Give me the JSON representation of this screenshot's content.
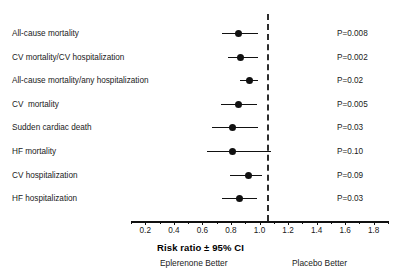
{
  "chart_data": {
    "type": "forest",
    "title": "",
    "xlabel": "Risk ratio ± 95% CI",
    "ylabel": "",
    "xlim": [
      0.1,
      1.9
    ],
    "grid": false,
    "null_value": 1.0,
    "tick_labels": [
      "0.2",
      "0.4",
      "0.6",
      "0.8",
      "1.0",
      "1.2",
      "1.4",
      "1.6",
      "1.8"
    ],
    "tick_values": [
      0.2,
      0.4,
      0.6,
      0.8,
      1.0,
      1.2,
      1.4,
      1.6,
      1.8
    ],
    "minor_tick_values": [
      0.1,
      0.3,
      0.5,
      0.7,
      0.9,
      1.1,
      1.3,
      1.5,
      1.7,
      1.9
    ],
    "left_caption": "Eplerenone Better",
    "right_caption": "Placebo Better",
    "categories": [
      "All-cause mortality",
      "CV mortality/CV hospitalization",
      "All-cause mortality/any hospitalization",
      "CV  mortality",
      "Sudden cardiac death",
      "HF mortality",
      "CV hospitalization",
      "HF hospitalization"
    ],
    "rows": [
      {
        "label": "All-cause mortality",
        "estimate": 0.85,
        "ci_low": 0.74,
        "ci_high": 0.99,
        "pvalue": "P=0.008"
      },
      {
        "label": "CV mortality/CV hospitalization",
        "estimate": 0.87,
        "ci_low": 0.78,
        "ci_high": 0.99,
        "pvalue": "P=0.002"
      },
      {
        "label": "All-cause mortality/any hospitalization",
        "estimate": 0.93,
        "ci_low": 0.86,
        "ci_high": 0.99,
        "pvalue": "P=0.02"
      },
      {
        "label": "CV  mortality",
        "estimate": 0.85,
        "ci_low": 0.73,
        "ci_high": 0.98,
        "pvalue": "P=0.005"
      },
      {
        "label": "Sudden cardiac death",
        "estimate": 0.81,
        "ci_low": 0.67,
        "ci_high": 0.99,
        "pvalue": "P=0.03"
      },
      {
        "label": "HF mortality",
        "estimate": 0.81,
        "ci_low": 0.63,
        "ci_high": 1.08,
        "pvalue": "P=0.10"
      },
      {
        "label": "CV hospitalization",
        "estimate": 0.92,
        "ci_low": 0.79,
        "ci_high": 1.02,
        "pvalue": "P=0.09"
      },
      {
        "label": "HF hospitalization",
        "estimate": 0.86,
        "ci_low": 0.74,
        "ci_high": 0.98,
        "pvalue": "P=0.03"
      }
    ],
    "colors": {
      "marker": "#111111",
      "line": "#111111",
      "null_line": "#2b2b2b",
      "text": "#1a1a1a",
      "background": "#ffffff"
    }
  }
}
